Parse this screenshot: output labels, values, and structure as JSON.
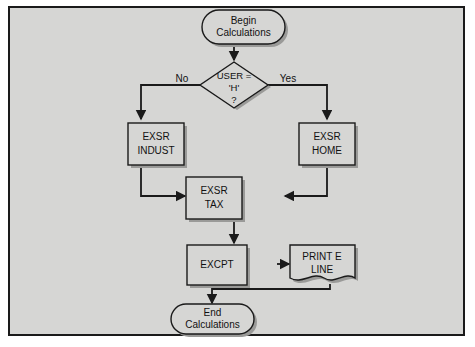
{
  "diagram": {
    "background_color": "#d6d6d4",
    "border_color": "#1a1a1a",
    "line_color": "#1a1a1a",
    "nodes": {
      "begin": {
        "type": "terminator",
        "line1": "Begin",
        "line2": "Calculations"
      },
      "decision": {
        "type": "decision",
        "line1": "USER =",
        "line2": "'H'",
        "line3": "?"
      },
      "indust": {
        "type": "process",
        "line1": "EXSR",
        "line2": "INDUST"
      },
      "home": {
        "type": "process",
        "line1": "EXSR",
        "line2": "HOME"
      },
      "tax": {
        "type": "process",
        "line1": "EXSR",
        "line2": "TAX"
      },
      "excpt": {
        "type": "process",
        "line1": "EXCPT",
        "line2": ""
      },
      "printline": {
        "type": "document",
        "line1": "PRINT E",
        "line2": "LINE"
      },
      "end": {
        "type": "terminator",
        "line1": "End",
        "line2": "Calculations"
      }
    },
    "edge_labels": {
      "no": "No",
      "yes": "Yes"
    }
  }
}
